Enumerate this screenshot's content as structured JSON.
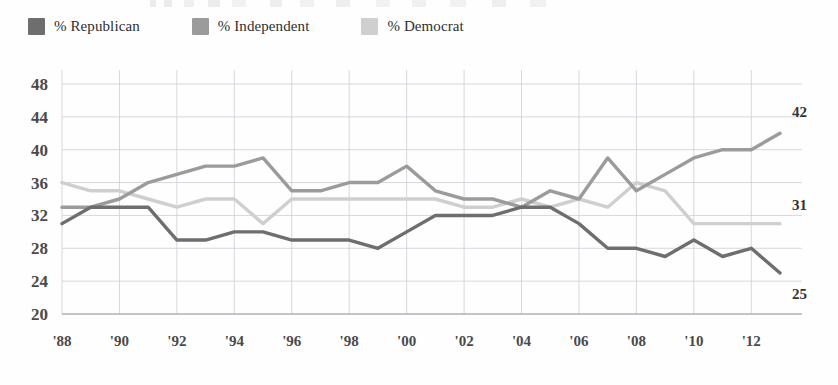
{
  "legend": {
    "items": [
      {
        "label": "% Republican",
        "color": "#6e6e6e",
        "key": "republican"
      },
      {
        "label": "% Independent",
        "color": "#9b9b9b",
        "key": "independent"
      },
      {
        "label": "% Democrat",
        "color": "#cfcfcf",
        "key": "democrat"
      }
    ]
  },
  "end_labels": {
    "independent": "42",
    "democrat": "31",
    "republican": "25"
  },
  "chart_data": {
    "type": "line",
    "title": "",
    "xlabel": "",
    "ylabel": "",
    "ylim": [
      20,
      48
    ],
    "ytick_step": 4,
    "ytick_labels": [
      "48",
      "44",
      "40",
      "36",
      "32",
      "28",
      "24",
      "20"
    ],
    "ytick_values": [
      48,
      44,
      40,
      36,
      32,
      28,
      24,
      20
    ],
    "xtick_labels": [
      "'88",
      "'90",
      "'92",
      "'94",
      "'96",
      "'98",
      "'00",
      "'02",
      "'04",
      "'06",
      "'08",
      "'10",
      "'12"
    ],
    "xtick_values": [
      1988,
      1990,
      1992,
      1994,
      1996,
      1998,
      2000,
      2002,
      2004,
      2006,
      2008,
      2010,
      2012
    ],
    "xlim": [
      1988,
      2013
    ],
    "grid": "both",
    "legend_position": "above-plot-left",
    "x": [
      1988,
      1989,
      1990,
      1991,
      1992,
      1993,
      1994,
      1995,
      1996,
      1997,
      1998,
      1999,
      2000,
      2001,
      2002,
      2003,
      2004,
      2005,
      2006,
      2007,
      2008,
      2009,
      2010,
      2011,
      2012,
      2013
    ],
    "series": [
      {
        "name": "% Republican",
        "color": "#6e6e6e",
        "values": [
          31,
          33,
          33,
          33,
          29,
          29,
          30,
          30,
          29,
          29,
          29,
          28,
          30,
          32,
          32,
          32,
          33,
          33,
          31,
          28,
          28,
          27,
          29,
          27,
          28,
          25
        ],
        "end_label": "25"
      },
      {
        "name": "% Independent",
        "color": "#9b9b9b",
        "values": [
          33,
          33,
          34,
          36,
          37,
          38,
          38,
          39,
          35,
          35,
          36,
          36,
          38,
          35,
          34,
          34,
          33,
          35,
          34,
          39,
          35,
          37,
          39,
          40,
          40,
          42
        ],
        "end_label": "42"
      },
      {
        "name": "% Democrat",
        "color": "#cfcfcf",
        "values": [
          36,
          35,
          35,
          34,
          33,
          34,
          34,
          31,
          34,
          34,
          34,
          34,
          34,
          34,
          33,
          33,
          34,
          33,
          34,
          33,
          36,
          35,
          31,
          31,
          31,
          31
        ],
        "end_label": "31"
      }
    ]
  }
}
